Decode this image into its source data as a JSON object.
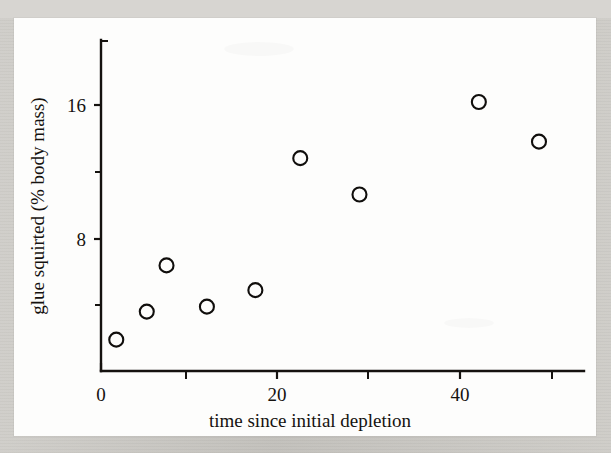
{
  "figure": {
    "background_color": "#fdfdfc",
    "page_color": "#cac8c3",
    "ink_color": "#15120f"
  },
  "chart_data": {
    "type": "scatter",
    "title": "",
    "subtitle": "",
    "xlabel": "time since initial depletion",
    "ylabel": "glue squirted (% body mass)",
    "xlim": [
      0,
      52
    ],
    "ylim": [
      0,
      22
    ],
    "grid": false,
    "legend": null,
    "x_ticks_major": [
      0,
      20,
      40
    ],
    "x_tick_labels": [
      "0",
      "20",
      "40"
    ],
    "x_ticks_minor": [
      10,
      30,
      50
    ],
    "y_ticks_major": [
      8,
      16
    ],
    "y_tick_labels": [
      "8",
      "16"
    ],
    "y_ticks_minor": [
      4,
      12,
      20
    ],
    "marker": "open-circle",
    "marker_radius_px": 7,
    "points": [
      {
        "x": 1.7,
        "y": 1.9
      },
      {
        "x": 5.1,
        "y": 3.6
      },
      {
        "x": 7.3,
        "y": 6.4
      },
      {
        "x": 11.8,
        "y": 3.9
      },
      {
        "x": 17.2,
        "y": 4.9
      },
      {
        "x": 22.2,
        "y": 12.9
      },
      {
        "x": 28.8,
        "y": 10.7
      },
      {
        "x": 42.1,
        "y": 16.3
      },
      {
        "x": 48.8,
        "y": 13.9
      }
    ]
  }
}
